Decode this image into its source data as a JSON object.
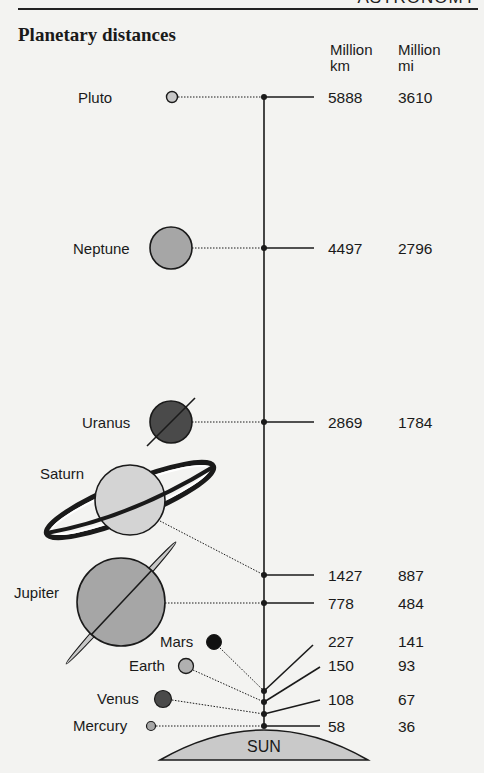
{
  "header": {
    "section_label": "ASTRONOMY"
  },
  "title": "Planetary distances",
  "columns": {
    "km": {
      "line1": "Million",
      "line2": "km"
    },
    "mi": {
      "line1": "Million",
      "line2": "mi"
    }
  },
  "sun_label": "SUN",
  "planets": [
    {
      "name": "Pluto",
      "km": "5888",
      "mi": "3610"
    },
    {
      "name": "Neptune",
      "km": "4497",
      "mi": "2796"
    },
    {
      "name": "Uranus",
      "km": "2869",
      "mi": "1784"
    },
    {
      "name": "Saturn",
      "km": "1427",
      "mi": "887"
    },
    {
      "name": "Jupiter",
      "km": "778",
      "mi": "484"
    },
    {
      "name": "Mars",
      "km": "227",
      "mi": "141"
    },
    {
      "name": "Earth",
      "km": "150",
      "mi": "93"
    },
    {
      "name": "Venus",
      "km": "108",
      "mi": "67"
    },
    {
      "name": "Mercury",
      "km": "58",
      "mi": "36"
    }
  ],
  "colors": {
    "background": "#f3f3f1",
    "ink": "#1a1a1a",
    "light_gray": "#c8c8c8",
    "mid_gray": "#a6a6a6",
    "dark_gray": "#4a4a4a",
    "sun_fill": "#c9c9c9"
  }
}
